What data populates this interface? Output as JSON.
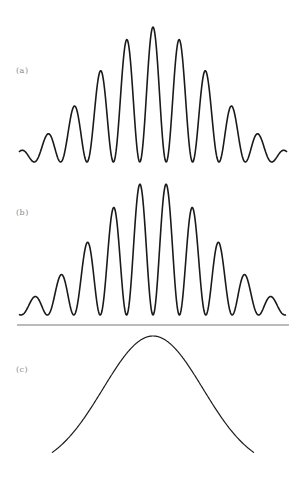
{
  "figure": {
    "line_color": "#1a1a1a",
    "baseline_color": "#777777",
    "label_color": "#888888"
  },
  "panels": [
    {
      "id": "a",
      "label": "(a)",
      "label_pos": [
        16,
        66
      ]
    },
    {
      "id": "b",
      "label": "(b)",
      "label_pos": [
        16,
        208
      ]
    },
    {
      "id": "c",
      "label": "(c)",
      "label_pos": [
        16,
        365
      ]
    }
  ],
  "chart_data": [
    {
      "type": "line",
      "title": "(a)",
      "description": "Cosine-squared fringes with central maximum under a Gaussian envelope (9 visible peaks)",
      "center_x": 153,
      "fringe_period_px": 26.4,
      "fringe_phase": "max_at_center",
      "envelope_sigma_fringes": 2.25,
      "x_range_px": [
        19,
        287
      ],
      "baseline_y": 162,
      "amplitude_px": 135,
      "relative_peak_heights": [
        0.21,
        0.41,
        0.67,
        0.91,
        1.0,
        0.91,
        0.67,
        0.41,
        0.21
      ],
      "xlabel": "",
      "ylabel": "",
      "grid": false
    },
    {
      "type": "line",
      "title": "(b)",
      "description": "Cosine-squared fringes with central minimum under a Gaussian envelope (10 visible peaks)",
      "center_x": 153,
      "fringe_period_px": 26.4,
      "fringe_phase": "min_at_center",
      "envelope_sigma_fringes": 2.25,
      "x_range_px": [
        19,
        286
      ],
      "baseline_y": 315,
      "amplitude_px": 134,
      "relative_peak_heights": [
        0.14,
        0.31,
        0.55,
        0.82,
        1.0,
        1.0,
        0.82,
        0.55,
        0.31,
        0.14
      ],
      "axis_line": {
        "y": 325,
        "x_range": [
          17,
          289
        ]
      },
      "xlabel": "",
      "ylabel": "",
      "grid": false
    },
    {
      "type": "line",
      "title": "(c)",
      "description": "Smooth Gaussian envelope",
      "center_x": 153,
      "sigma_px": 50,
      "x_range_px": [
        52,
        254
      ],
      "baseline_y": 470,
      "amplitude_px": 134,
      "xlabel": "",
      "ylabel": "",
      "grid": false
    }
  ]
}
